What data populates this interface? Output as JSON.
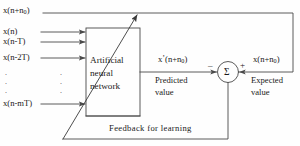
{
  "figure": {
    "type": "block-diagram",
    "line_color": "#4a4a4a",
    "text_color": "#1a1a1a",
    "background": "#fefefe"
  },
  "top_feedback": {
    "label_prefix": "x(n+n",
    "label_sub": "0",
    "label_suffix": ")"
  },
  "inputs": [
    {
      "text": "x(n)",
      "arrow": true
    },
    {
      "text": "x(n-T)",
      "arrow": true
    },
    {
      "text": "x(n-2T)",
      "arrow": true
    },
    {
      "text": "x(n-mT)",
      "arrow": true
    }
  ],
  "vertical_dots": ".\n.\n.",
  "dots_left": ".",
  "block": {
    "line1": "Artificial",
    "line2": "neural",
    "line3": "network"
  },
  "predicted": {
    "signal_prefix": "x",
    "signal_prime": "’",
    "signal_mid": "(n+n",
    "signal_sub": "0",
    "signal_suffix": ")",
    "caption_line1": "Predicted",
    "caption_line2": "value"
  },
  "summing_junction": {
    "symbol": "Σ",
    "minus_sign": "–",
    "plus_sign": "+"
  },
  "expected": {
    "signal_prefix": "x(n+n",
    "signal_sub": "0",
    "signal_suffix": ")",
    "caption_line1": "Expected",
    "caption_line2": "value"
  },
  "feedback": {
    "label": "Feedback for learning"
  }
}
